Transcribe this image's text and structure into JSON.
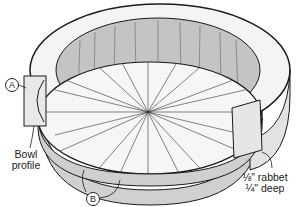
{
  "diagram": {
    "type": "woodworking exploded/cutaway illustration",
    "callouts": [
      {
        "id": "A",
        "label": "A"
      },
      {
        "id": "B",
        "label": "B"
      }
    ],
    "annotations": {
      "bowl_profile_line1": "Bowl",
      "bowl_profile_line2": "profile",
      "rabbet_line1": "⅛\" rabbet",
      "rabbet_line2": "¼\" deep"
    },
    "colors": {
      "line": "#1a1a1a",
      "wood_light": "#f2f2f2",
      "wood_shade": "#bdbdbd",
      "wood_mid": "#d9d9d9",
      "background": "#ffffff"
    }
  }
}
